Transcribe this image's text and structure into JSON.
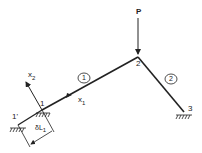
{
  "diagram": {
    "load_label": "P",
    "nodes": [
      {
        "id": "1",
        "label": "1"
      },
      {
        "id": "1p",
        "label": "1'"
      },
      {
        "id": "2",
        "label": "2"
      },
      {
        "id": "3",
        "label": "3"
      }
    ],
    "members": [
      {
        "id": "m1",
        "label": "1"
      },
      {
        "id": "m2",
        "label": "2"
      }
    ],
    "axes": {
      "x1": {
        "base": "x",
        "sub": "1"
      },
      "x2": {
        "base": "x",
        "sub": "2"
      }
    },
    "displacement": {
      "base": "δL",
      "sub": "1"
    },
    "colors": {
      "line": "#222222",
      "background": "#ffffff"
    }
  }
}
